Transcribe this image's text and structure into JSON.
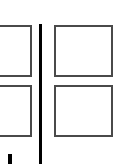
{
  "diagram": {
    "colors": {
      "background": "#ffffff",
      "panel_border": "#4a4a4a",
      "divider": "#000000"
    },
    "panels": [
      {
        "id": "left-top",
        "x": -4,
        "y": 25,
        "w": 36,
        "h": 52
      },
      {
        "id": "left-bottom",
        "x": -4,
        "y": 85,
        "w": 36,
        "h": 52
      },
      {
        "id": "right-top",
        "x": 54,
        "y": 25,
        "w": 59,
        "h": 52
      },
      {
        "id": "right-bottom",
        "x": 54,
        "y": 85,
        "w": 59,
        "h": 52
      }
    ],
    "divider": {
      "x": 39,
      "y": 24,
      "w": 3,
      "h": 140
    },
    "stub": {
      "x": 8,
      "y": 154,
      "w": 4,
      "h": 10
    }
  }
}
